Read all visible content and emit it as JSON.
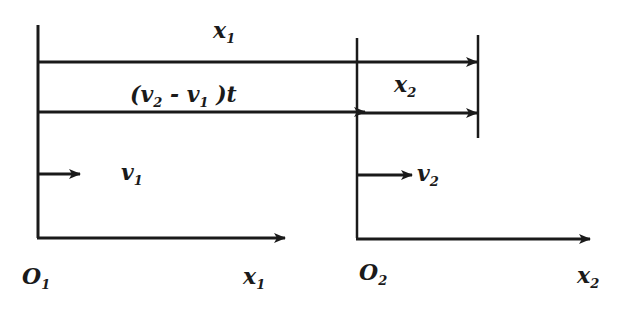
{
  "diagram": {
    "colors": {
      "ink": "#1a1a1a",
      "background": "#ffffff"
    },
    "labels": {
      "x1_top": {
        "base": "x",
        "sub": "1"
      },
      "relative_disp": {
        "text_open": "(v",
        "sub_a": "2",
        "mid": " - v",
        "sub_b": "1",
        "close": " )t"
      },
      "x2_mid": {
        "base": "x",
        "sub": "2"
      },
      "v1": {
        "base": "v",
        "sub": "1"
      },
      "v2": {
        "base": "v",
        "sub": "2"
      },
      "origin1": {
        "base": "O",
        "sub": "1"
      },
      "origin2": {
        "base": "O",
        "sub": "2"
      },
      "axis_x1": {
        "base": "x",
        "sub": "1"
      },
      "axis_x2": {
        "base": "x",
        "sub": "2"
      }
    }
  }
}
